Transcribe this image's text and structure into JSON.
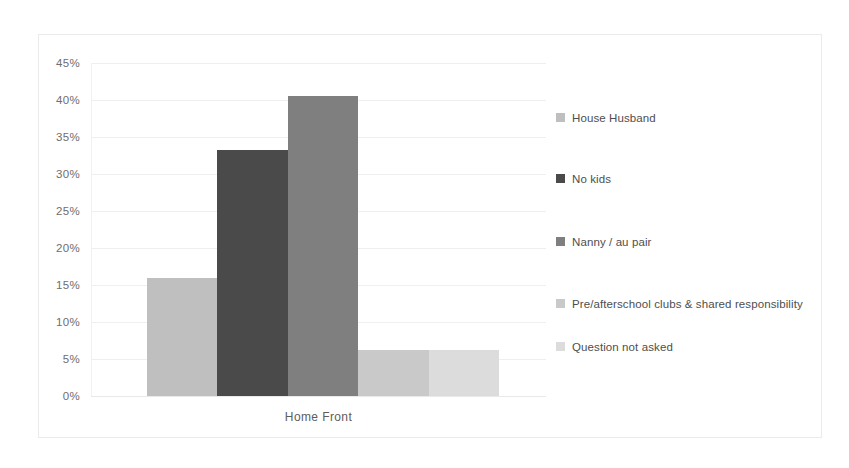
{
  "chart_data": {
    "type": "bar",
    "title": "",
    "subtitle": "",
    "xlabel": "",
    "ylabel": "",
    "categories": [
      "Home Front"
    ],
    "category_label": "Home Front",
    "ylim": [
      0,
      45
    ],
    "ytick_values": [
      45,
      40,
      35,
      30,
      25,
      20,
      15,
      10,
      5,
      0
    ],
    "ytick_labels": [
      "45%",
      "40%",
      "35%",
      "30%",
      "25%",
      "20%",
      "15%",
      "10%",
      "5%",
      "0%"
    ],
    "grid": true,
    "legend_position": "right",
    "series": [
      {
        "name": "House Husband",
        "values": [
          15.9
        ],
        "color": "#bfbfbf"
      },
      {
        "name": "No kids",
        "values": [
          33.3
        ],
        "color": "#4a4a4a"
      },
      {
        "name": "Nanny / au pair",
        "values": [
          40.5
        ],
        "color": "#7f7f7f"
      },
      {
        "name": "Pre/afterschool clubs & shared responsibility",
        "values": [
          6.2
        ],
        "color": "#c9c9c9"
      },
      {
        "name": "Question not asked",
        "values": [
          6.2
        ],
        "color": "#dcdcdc"
      }
    ]
  },
  "colors": {
    "background": "#ffffff",
    "frame_border": "#eceaea",
    "gridline": "#f0eeee",
    "axis_text": "#6e6e6e",
    "legend_text": "#4e4e4e"
  }
}
